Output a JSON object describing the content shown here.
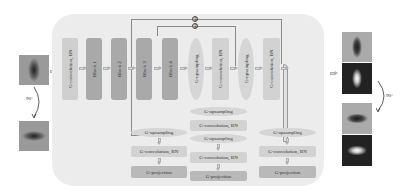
{
  "diagram": {
    "type": "neural-network-architecture",
    "input": {
      "rotation_label": "90°",
      "images": [
        "input-vertical-blob",
        "input-horizontal-blob"
      ]
    },
    "encoder": {
      "stem": "G-convolution, BN",
      "blocks": [
        "Block 1",
        "Block 2",
        "Block 3",
        "Block 4"
      ]
    },
    "decoder_main": [
      "G-upsampling",
      "G-convolution, BN",
      "G-upsampling",
      "G-convolution, BN"
    ],
    "skip_symbol": "⊕",
    "heads": [
      {
        "upsampling": "G-upsampling",
        "conv": "G-convolution, BN",
        "projection": "G-projection"
      },
      {
        "upsampling": "G-upsampling",
        "conv": "G-convolution, BN",
        "upsampling2": "G-upsampling",
        "conv2": "G-convolution, BN",
        "projection": "G-projection"
      },
      {
        "upsampling": "G-upsampling",
        "conv": "G-convolution, BN",
        "projection": "G-projection"
      }
    ],
    "output": {
      "rotation_label": "90°",
      "images": [
        "output-vertical-dark",
        "output-vertical-bright",
        "output-horizontal-dark",
        "output-horizontal-bright"
      ]
    }
  }
}
